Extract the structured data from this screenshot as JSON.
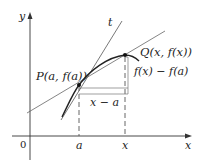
{
  "figure": {
    "colors": {
      "axis": "#333333",
      "curve": "#222222",
      "lines": "#666666",
      "dashed": "#555555",
      "point": "#111111"
    },
    "axes": {
      "x_label": "x",
      "y_label": "y",
      "origin_label": "0"
    },
    "ticks": {
      "a_label": "a",
      "x_label": "x"
    },
    "points": {
      "P_label": "P(a, f(a))",
      "Q_label": "Q(x, f(x))"
    },
    "lines": {
      "tangent_label": "t"
    },
    "annotations": {
      "horizontal_diff": "x − a",
      "vertical_diff": "f(x) − f(a)"
    }
  }
}
